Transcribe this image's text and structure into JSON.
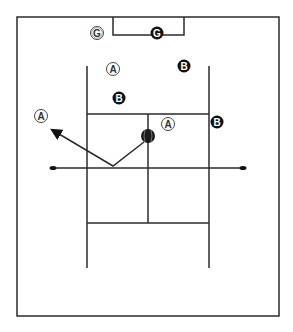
{
  "diagram": {
    "title": "",
    "players": [
      {
        "label": "G",
        "team": "white",
        "x": 97,
        "y": 33
      },
      {
        "label": "G",
        "team": "black",
        "x": 157,
        "y": 33
      },
      {
        "label": "A",
        "team": "white",
        "x": 113,
        "y": 69
      },
      {
        "label": "B",
        "team": "black",
        "x": 184,
        "y": 66
      },
      {
        "label": "B",
        "team": "black",
        "x": 119,
        "y": 98
      },
      {
        "label": "A",
        "team": "white",
        "x": 41,
        "y": 116
      },
      {
        "label": "A",
        "team": "white",
        "x": 168,
        "y": 124
      },
      {
        "label": "B",
        "team": "black",
        "x": 217,
        "y": 122
      }
    ],
    "ball": {
      "x": 148,
      "y": 136
    },
    "colors": {
      "line": "#2b2b2b",
      "black_marker": "#111111",
      "white_marker": "#ffffff"
    }
  }
}
